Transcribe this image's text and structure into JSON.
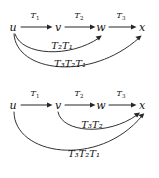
{
  "figure": {
    "name": "composition-of-linear-transformations",
    "background_color": "#ffffff",
    "ink_color": "#262626"
  },
  "diagrams": [
    {
      "id": "top",
      "nodes": [
        {
          "label": "u",
          "x": 13,
          "y": 27
        },
        {
          "label": "v",
          "x": 58,
          "y": 27
        },
        {
          "label": "w",
          "x": 101,
          "y": 27
        },
        {
          "label": "x",
          "x": 142,
          "y": 27
        }
      ],
      "straight_arrows": [
        {
          "label": "T",
          "sub": "1",
          "from": "u",
          "to": "v",
          "label_x": 35,
          "label_y": 16
        },
        {
          "label": "T",
          "sub": "2",
          "from": "v",
          "to": "w",
          "label_x": 79,
          "label_y": 16
        },
        {
          "label": "T",
          "sub": "3",
          "from": "w",
          "to": "x",
          "label_x": 121,
          "label_y": 16
        }
      ],
      "curved_arrows": [
        {
          "label": "T₂T₁",
          "from": "u",
          "to": "w",
          "label_x": 62,
          "label_y": 46
        },
        {
          "label": "T₃T₂T₁",
          "from": "u",
          "to": "x",
          "label_x": 70,
          "label_y": 64
        }
      ]
    },
    {
      "id": "bottom",
      "nodes": [
        {
          "label": "u",
          "x": 13,
          "y": 16
        },
        {
          "label": "v",
          "x": 58,
          "y": 16
        },
        {
          "label": "w",
          "x": 101,
          "y": 16
        },
        {
          "label": "x",
          "x": 142,
          "y": 16
        }
      ],
      "straight_arrows": [
        {
          "label": "T",
          "sub": "1",
          "from": "u",
          "to": "v",
          "label_x": 35,
          "label_y": 5
        },
        {
          "label": "T",
          "sub": "2",
          "from": "v",
          "to": "w",
          "label_x": 79,
          "label_y": 5
        },
        {
          "label": "T",
          "sub": "3",
          "from": "w",
          "to": "x",
          "label_x": 121,
          "label_y": 5
        }
      ],
      "curved_arrows": [
        {
          "label": "T₃T₂",
          "from": "v",
          "to": "x",
          "label_x": 92,
          "label_y": 36
        },
        {
          "label": "T₃T₂T₁",
          "from": "u",
          "to": "x",
          "label_x": 84,
          "label_y": 65
        }
      ]
    }
  ],
  "labels": {
    "top": {
      "t1": "T",
      "t1_sub": "1",
      "t2": "T",
      "t2_sub": "2",
      "t3": "T",
      "t3_sub": "3",
      "node_u": "u",
      "node_v": "v",
      "node_w": "w",
      "node_x": "x",
      "curve_upper": "T",
      "curve_upper_sub2": "2",
      "curve_upper_t1": "T",
      "curve_upper_sub1": "1",
      "curve_lower": "T",
      "curve_lower_sub3": "3"
    },
    "bottom": {
      "t1": "T",
      "t1_sub": "1",
      "t2": "T",
      "t2_sub": "2",
      "t3": "T",
      "t3_sub": "3",
      "node_u": "u",
      "node_v": "v",
      "node_w": "w",
      "node_x": "x"
    }
  }
}
